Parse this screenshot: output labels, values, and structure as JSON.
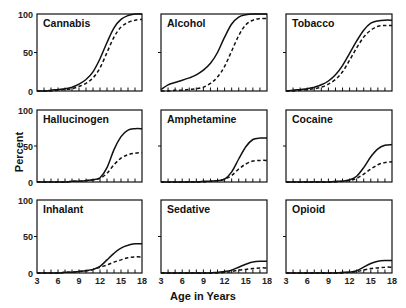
{
  "chart_data": {
    "type": "line",
    "layout": "3x3 small multiples",
    "xlabel": "Age in Years",
    "ylabel": "Percent",
    "xlim": [
      3,
      18
    ],
    "ylim": [
      0,
      100
    ],
    "x_ticks": [
      3,
      6,
      9,
      12,
      15,
      18
    ],
    "y_ticks": [
      0,
      50,
      100
    ],
    "grid": false,
    "legend": "none (solid line vs dashed line series)",
    "x": [
      3,
      4,
      5,
      6,
      7,
      8,
      9,
      10,
      11,
      12,
      13,
      14,
      15,
      16,
      17,
      18
    ],
    "panels": [
      {
        "title": "Cannabis",
        "series": [
          {
            "name": "solid",
            "style": "solid",
            "values": [
              0,
              0,
              1,
              2,
              3,
              5,
              9,
              15,
              25,
              42,
              63,
              82,
              93,
              98,
              100,
              100
            ]
          },
          {
            "name": "dashed",
            "style": "dashed",
            "values": [
              0,
              0,
              0,
              1,
              2,
              3,
              6,
              10,
              17,
              30,
              50,
              70,
              83,
              89,
              92,
              93
            ]
          }
        ]
      },
      {
        "title": "Alcohol",
        "series": [
          {
            "name": "solid",
            "style": "solid",
            "values": [
              2,
              8,
              11,
              14,
              17,
              21,
              27,
              36,
              50,
              70,
              87,
              96,
              99,
              100,
              100,
              100
            ]
          },
          {
            "name": "dashed",
            "style": "dashed",
            "values": [
              0,
              0,
              1,
              1,
              2,
              3,
              5,
              10,
              18,
              32,
              52,
              72,
              86,
              92,
              94,
              94
            ]
          }
        ]
      },
      {
        "title": "Tobacco",
        "series": [
          {
            "name": "solid",
            "style": "solid",
            "values": [
              0,
              1,
              2,
              3,
              5,
              8,
              13,
              21,
              33,
              49,
              65,
              79,
              88,
              91,
              92,
              92
            ]
          },
          {
            "name": "dashed",
            "style": "dashed",
            "values": [
              0,
              0,
              1,
              2,
              3,
              5,
              9,
              15,
              25,
              40,
              56,
              70,
              79,
              84,
              85,
              85
            ]
          }
        ]
      },
      {
        "title": "Hallucinogen",
        "series": [
          {
            "name": "solid",
            "style": "solid",
            "values": [
              0,
              0,
              0,
              0,
              0,
              1,
              1,
              2,
              3,
              6,
              20,
              45,
              63,
              72,
              74,
              74
            ]
          },
          {
            "name": "dashed",
            "style": "dashed",
            "values": [
              0,
              0,
              0,
              0,
              0,
              1,
              1,
              2,
              3,
              5,
              12,
              24,
              33,
              38,
              40,
              41
            ]
          }
        ]
      },
      {
        "title": "Amphetamine",
        "series": [
          {
            "name": "solid",
            "style": "solid",
            "values": [
              0,
              0,
              0,
              0,
              0,
              0,
              1,
              1,
              2,
              4,
              14,
              32,
              49,
              59,
              61,
              61
            ]
          },
          {
            "name": "dashed",
            "style": "dashed",
            "values": [
              0,
              0,
              0,
              0,
              0,
              0,
              0,
              1,
              2,
              4,
              9,
              18,
              25,
              29,
              30,
              30
            ]
          }
        ]
      },
      {
        "title": "Cocaine",
        "series": [
          {
            "name": "solid",
            "style": "solid",
            "values": [
              0,
              0,
              0,
              0,
              0,
              0,
              0,
              1,
              1,
              3,
              8,
              20,
              35,
              46,
              51,
              52
            ]
          },
          {
            "name": "dashed",
            "style": "dashed",
            "values": [
              0,
              0,
              0,
              0,
              0,
              0,
              0,
              0,
              1,
              2,
              5,
              11,
              18,
              24,
              27,
              28
            ]
          }
        ]
      },
      {
        "title": "Inhalant",
        "series": [
          {
            "name": "solid",
            "style": "solid",
            "values": [
              0,
              0,
              0,
              0,
              1,
              1,
              2,
              3,
              5,
              9,
              18,
              27,
              34,
              38,
              40,
              40
            ]
          },
          {
            "name": "dashed",
            "style": "dashed",
            "values": [
              0,
              0,
              0,
              0,
              1,
              1,
              2,
              3,
              5,
              8,
              11,
              15,
              18,
              21,
              22,
              22
            ]
          }
        ]
      },
      {
        "title": "Sedative",
        "series": [
          {
            "name": "solid",
            "style": "solid",
            "values": [
              0,
              0,
              0,
              0,
              0,
              0,
              0,
              0,
              1,
              2,
              4,
              8,
              12,
              15,
              16,
              16
            ]
          },
          {
            "name": "dashed",
            "style": "dashed",
            "values": [
              0,
              0,
              0,
              0,
              0,
              0,
              0,
              0,
              0,
              1,
              2,
              4,
              5,
              6,
              7,
              7
            ]
          }
        ]
      },
      {
        "title": "Opioid",
        "series": [
          {
            "name": "solid",
            "style": "solid",
            "values": [
              0,
              0,
              0,
              0,
              0,
              0,
              0,
              0,
              1,
              1,
              3,
              8,
              13,
              16,
              17,
              17
            ]
          },
          {
            "name": "dashed",
            "style": "dashed",
            "values": [
              0,
              0,
              0,
              0,
              0,
              0,
              0,
              0,
              0,
              1,
              2,
              4,
              6,
              7,
              8,
              8
            ]
          }
        ]
      }
    ]
  },
  "labels": {
    "ylabel": "Percent",
    "xlabel": "Age in Years"
  },
  "colors": {
    "line": "#111111",
    "background": "#ffffff"
  }
}
